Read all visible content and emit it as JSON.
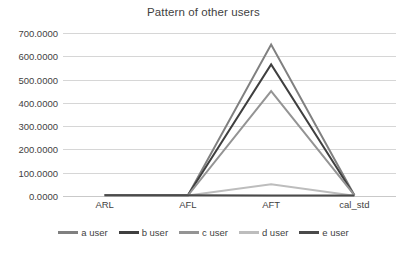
{
  "chart_data": {
    "type": "line",
    "title": "Pattern of other users",
    "xlabel": "",
    "ylabel": "",
    "categories": [
      "ARL",
      "AFL",
      "AFT",
      "cal_std"
    ],
    "ylim": [
      0,
      700
    ],
    "ytick_step": 100,
    "ytick_labels": [
      "0.0000",
      "100.0000",
      "200.0000",
      "300.0000",
      "400.0000",
      "500.0000",
      "600.0000",
      "700.0000"
    ],
    "ytick_values": [
      0,
      100,
      200,
      300,
      400,
      500,
      600,
      700
    ],
    "grid": true,
    "legend_position": "bottom",
    "series": [
      {
        "name": "a user",
        "values": [
          3,
          2,
          650,
          3
        ],
        "color": "#808080"
      },
      {
        "name": "b user",
        "values": [
          4,
          3,
          565,
          2
        ],
        "color": "#3f3f3f"
      },
      {
        "name": "c user",
        "values": [
          2,
          2,
          450,
          4
        ],
        "color": "#949494"
      },
      {
        "name": "d user",
        "values": [
          1,
          2,
          50,
          1
        ],
        "color": "#bdbdbd"
      },
      {
        "name": "e user",
        "values": [
          3,
          3,
          2,
          2
        ],
        "color": "#4a4a4a"
      }
    ]
  },
  "legend": {
    "items": [
      {
        "label": "a user"
      },
      {
        "label": "b user"
      },
      {
        "label": "c user"
      },
      {
        "label": "d user"
      },
      {
        "label": "e user"
      }
    ]
  }
}
